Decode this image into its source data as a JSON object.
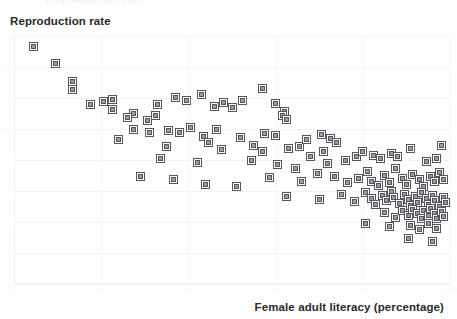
{
  "chart_data": {
    "type": "scatter",
    "title": "",
    "xlabel": "Female adult literacy (percentage)",
    "ylabel": "Reproduction rate",
    "xlim": [
      0,
      100
    ],
    "ylim": [
      0,
      4.0
    ],
    "grid": true,
    "legend": null,
    "marker": {
      "shape": "square",
      "size_px": 7,
      "edge_color": "#55555c",
      "face_color": "#9a9aa1"
    },
    "xticks": [
      0,
      20,
      40,
      60,
      80,
      100
    ],
    "yticks": [
      0,
      0.5,
      1.0,
      1.5,
      2.0,
      2.5,
      3.0,
      3.5,
      4.0
    ],
    "xtick_labels": [
      "0",
      "20",
      "40",
      "60",
      "80",
      "100"
    ],
    "ytick_labels": [
      "0",
      ".5",
      "1",
      "1.5",
      "2",
      "2.5",
      "3",
      "3.5",
      "4"
    ],
    "clipped_top_text": "Reproduction rate",
    "point_count": 137,
    "points": [
      {
        "x": 4.5,
        "y": 3.83
      },
      {
        "x": 9.5,
        "y": 3.56
      },
      {
        "x": 13.5,
        "y": 3.27
      },
      {
        "x": 13.5,
        "y": 3.13
      },
      {
        "x": 17.5,
        "y": 2.9
      },
      {
        "x": 20.5,
        "y": 2.95
      },
      {
        "x": 22.5,
        "y": 2.98
      },
      {
        "x": 22.5,
        "y": 2.82
      },
      {
        "x": 27.5,
        "y": 2.75
      },
      {
        "x": 26.0,
        "y": 2.68
      },
      {
        "x": 30.5,
        "y": 2.64
      },
      {
        "x": 32.5,
        "y": 2.72
      },
      {
        "x": 37.0,
        "y": 3.01
      },
      {
        "x": 27.5,
        "y": 2.49
      },
      {
        "x": 31.0,
        "y": 2.44
      },
      {
        "x": 24.0,
        "y": 2.33
      },
      {
        "x": 33.0,
        "y": 2.9
      },
      {
        "x": 35.5,
        "y": 2.47
      },
      {
        "x": 39.5,
        "y": 2.96
      },
      {
        "x": 43.0,
        "y": 3.06
      },
      {
        "x": 46.0,
        "y": 2.87
      },
      {
        "x": 48.0,
        "y": 2.93
      },
      {
        "x": 50.0,
        "y": 2.84
      },
      {
        "x": 52.5,
        "y": 2.96
      },
      {
        "x": 57.0,
        "y": 3.15
      },
      {
        "x": 60.0,
        "y": 2.92
      },
      {
        "x": 62.0,
        "y": 2.78
      },
      {
        "x": 61.5,
        "y": 2.72
      },
      {
        "x": 62.5,
        "y": 2.66
      },
      {
        "x": 40.5,
        "y": 2.53
      },
      {
        "x": 38.0,
        "y": 2.45
      },
      {
        "x": 43.5,
        "y": 2.38
      },
      {
        "x": 46.5,
        "y": 2.49
      },
      {
        "x": 52.0,
        "y": 2.36
      },
      {
        "x": 57.5,
        "y": 2.43
      },
      {
        "x": 60.0,
        "y": 2.39
      },
      {
        "x": 35.0,
        "y": 2.22
      },
      {
        "x": 44.5,
        "y": 2.28
      },
      {
        "x": 47.5,
        "y": 2.17
      },
      {
        "x": 55.0,
        "y": 2.24
      },
      {
        "x": 57.0,
        "y": 2.14
      },
      {
        "x": 63.0,
        "y": 2.19
      },
      {
        "x": 65.5,
        "y": 2.22
      },
      {
        "x": 67.0,
        "y": 2.33
      },
      {
        "x": 70.5,
        "y": 2.41
      },
      {
        "x": 72.5,
        "y": 2.35
      },
      {
        "x": 74.0,
        "y": 2.28
      },
      {
        "x": 71.0,
        "y": 2.14
      },
      {
        "x": 68.0,
        "y": 2.05
      },
      {
        "x": 33.5,
        "y": 2.03
      },
      {
        "x": 42.0,
        "y": 1.96
      },
      {
        "x": 54.5,
        "y": 2.0
      },
      {
        "x": 60.5,
        "y": 1.93
      },
      {
        "x": 64.5,
        "y": 1.87
      },
      {
        "x": 72.0,
        "y": 1.94
      },
      {
        "x": 76.0,
        "y": 1.99
      },
      {
        "x": 78.5,
        "y": 2.06
      },
      {
        "x": 80.0,
        "y": 2.13
      },
      {
        "x": 82.5,
        "y": 2.08
      },
      {
        "x": 84.0,
        "y": 2.02
      },
      {
        "x": 86.5,
        "y": 2.11
      },
      {
        "x": 88.0,
        "y": 2.05
      },
      {
        "x": 91.0,
        "y": 2.19
      },
      {
        "x": 94.5,
        "y": 1.97
      },
      {
        "x": 97.0,
        "y": 2.02
      },
      {
        "x": 98.0,
        "y": 2.23
      },
      {
        "x": 29.0,
        "y": 1.73
      },
      {
        "x": 36.5,
        "y": 1.68
      },
      {
        "x": 44.0,
        "y": 1.61
      },
      {
        "x": 51.0,
        "y": 1.58
      },
      {
        "x": 58.5,
        "y": 1.72
      },
      {
        "x": 66.0,
        "y": 1.66
      },
      {
        "x": 69.5,
        "y": 1.79
      },
      {
        "x": 73.5,
        "y": 1.74
      },
      {
        "x": 76.5,
        "y": 1.63
      },
      {
        "x": 79.0,
        "y": 1.7
      },
      {
        "x": 81.0,
        "y": 1.81
      },
      {
        "x": 82.0,
        "y": 1.66
      },
      {
        "x": 83.5,
        "y": 1.59
      },
      {
        "x": 85.0,
        "y": 1.75
      },
      {
        "x": 86.0,
        "y": 1.63
      },
      {
        "x": 87.5,
        "y": 1.86
      },
      {
        "x": 89.0,
        "y": 1.71
      },
      {
        "x": 90.0,
        "y": 1.61
      },
      {
        "x": 91.5,
        "y": 1.77
      },
      {
        "x": 93.0,
        "y": 1.68
      },
      {
        "x": 94.0,
        "y": 1.57
      },
      {
        "x": 95.5,
        "y": 1.73
      },
      {
        "x": 96.5,
        "y": 1.65
      },
      {
        "x": 97.5,
        "y": 1.8
      },
      {
        "x": 98.5,
        "y": 1.69
      },
      {
        "x": 62.5,
        "y": 1.42
      },
      {
        "x": 70.0,
        "y": 1.36
      },
      {
        "x": 75.0,
        "y": 1.44
      },
      {
        "x": 78.0,
        "y": 1.33
      },
      {
        "x": 80.5,
        "y": 1.47
      },
      {
        "x": 82.0,
        "y": 1.38
      },
      {
        "x": 83.0,
        "y": 1.28
      },
      {
        "x": 84.5,
        "y": 1.43
      },
      {
        "x": 85.5,
        "y": 1.34
      },
      {
        "x": 86.5,
        "y": 1.49
      },
      {
        "x": 87.0,
        "y": 1.39
      },
      {
        "x": 88.5,
        "y": 1.3
      },
      {
        "x": 89.5,
        "y": 1.45
      },
      {
        "x": 90.5,
        "y": 1.36
      },
      {
        "x": 91.0,
        "y": 1.26
      },
      {
        "x": 92.0,
        "y": 1.41
      },
      {
        "x": 92.5,
        "y": 1.32
      },
      {
        "x": 93.5,
        "y": 1.47
      },
      {
        "x": 94.5,
        "y": 1.38
      },
      {
        "x": 95.0,
        "y": 1.28
      },
      {
        "x": 96.0,
        "y": 1.43
      },
      {
        "x": 96.5,
        "y": 1.34
      },
      {
        "x": 97.5,
        "y": 1.25
      },
      {
        "x": 98.5,
        "y": 1.4
      },
      {
        "x": 99.0,
        "y": 1.31
      },
      {
        "x": 85.0,
        "y": 1.15
      },
      {
        "x": 87.5,
        "y": 1.08
      },
      {
        "x": 89.0,
        "y": 1.18
      },
      {
        "x": 90.5,
        "y": 1.1
      },
      {
        "x": 91.5,
        "y": 1.21
      },
      {
        "x": 92.5,
        "y": 1.13
      },
      {
        "x": 93.5,
        "y": 1.05
      },
      {
        "x": 94.0,
        "y": 1.19
      },
      {
        "x": 95.0,
        "y": 1.11
      },
      {
        "x": 95.5,
        "y": 1.22
      },
      {
        "x": 96.5,
        "y": 1.14
      },
      {
        "x": 97.0,
        "y": 1.06
      },
      {
        "x": 98.0,
        "y": 1.17
      },
      {
        "x": 98.5,
        "y": 1.09
      },
      {
        "x": 80.5,
        "y": 0.98
      },
      {
        "x": 86.0,
        "y": 0.93
      },
      {
        "x": 91.0,
        "y": 0.95
      },
      {
        "x": 93.0,
        "y": 0.88
      },
      {
        "x": 95.0,
        "y": 0.97
      },
      {
        "x": 97.0,
        "y": 0.9
      },
      {
        "x": 90.5,
        "y": 0.74
      },
      {
        "x": 96.0,
        "y": 0.69
      }
    ]
  }
}
